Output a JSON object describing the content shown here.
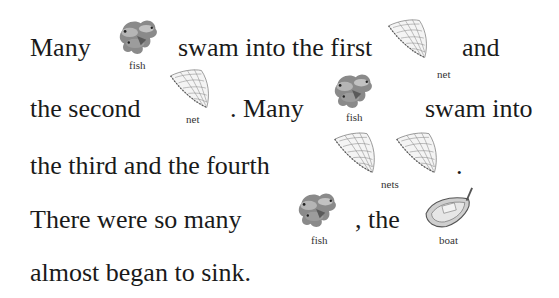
{
  "story": {
    "lines": [
      {
        "segments": [
          "Many",
          "swam into the first",
          "and"
        ]
      },
      {
        "segments": [
          "the second",
          ". Many",
          "swam into"
        ]
      },
      {
        "segments": [
          "the third and the fourth",
          "."
        ]
      },
      {
        "segments": [
          "There were so many",
          ", the"
        ]
      },
      {
        "segments": [
          "almost began to sink."
        ]
      }
    ]
  },
  "pictures": {
    "fish_1": {
      "icon": "fish-icon",
      "caption": "fish"
    },
    "net_1": {
      "icon": "net-icon",
      "caption": "net"
    },
    "net_2": {
      "icon": "net-icon",
      "caption": "net"
    },
    "fish_2": {
      "icon": "fish-icon",
      "caption": "fish"
    },
    "nets": {
      "icon": "net-icon",
      "caption": "nets"
    },
    "fish_3": {
      "icon": "fish-icon",
      "caption": "fish"
    },
    "boat": {
      "icon": "boat-icon",
      "caption": "boat"
    }
  }
}
